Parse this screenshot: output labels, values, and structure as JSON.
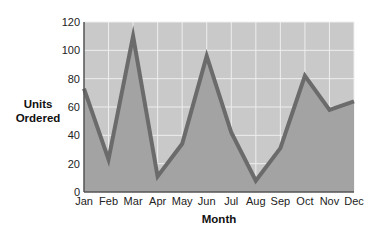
{
  "chart_data": {
    "type": "area",
    "title": "",
    "xlabel": "Month",
    "ylabel_lines": [
      "Units",
      "Ordered"
    ],
    "ylabel": "Units Ordered",
    "categories": [
      "Jan",
      "Feb",
      "Mar",
      "Apr",
      "May",
      "Jun",
      "Jul",
      "Aug",
      "Sep",
      "Oct",
      "Nov",
      "Dec"
    ],
    "series": [
      {
        "name": "Units Ordered",
        "values": [
          73,
          23,
          110,
          11,
          34,
          96,
          42,
          8,
          31,
          82,
          58,
          64
        ]
      }
    ],
    "ylim": [
      0,
      120
    ],
    "yticks": [
      0,
      20,
      40,
      60,
      80,
      100,
      120
    ],
    "grid": true,
    "legend": "none",
    "colors": {
      "plot_background": "#c9c9c9",
      "area_fill": "#a3a3a3",
      "line": "#6b6b6b",
      "grid": "#eeeeee",
      "axis": "#555555"
    }
  }
}
